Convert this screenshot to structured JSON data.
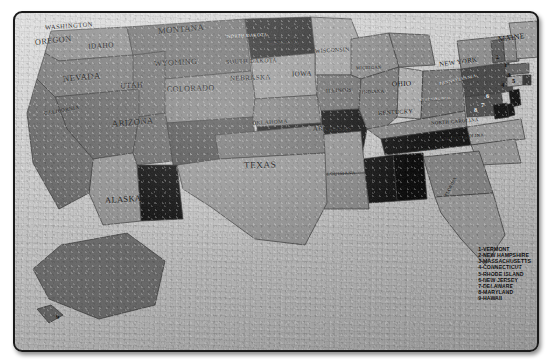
{
  "map": {
    "title": "United States of America",
    "type": "political-state-map",
    "style": "grayscale textured paper",
    "frame": {
      "border_color": "#1a1a1a",
      "background_color": "#cfcfcf"
    },
    "states": [
      {
        "name": "WASHINGTON",
        "x": 30,
        "y": 9,
        "size": 6.6,
        "rot": -4,
        "light": false,
        "fill": "#8d8d8d"
      },
      {
        "name": "OREGON",
        "x": 20,
        "y": 23,
        "size": 8.2,
        "rot": -6,
        "light": false,
        "fill": "#7a7a7a"
      },
      {
        "name": "IDAHO",
        "x": 73,
        "y": 28,
        "size": 7.4,
        "rot": -3,
        "light": false,
        "fill": "#6f6f6f"
      },
      {
        "name": "MONTANA",
        "x": 143,
        "y": 11,
        "size": 8.6,
        "rot": -5,
        "light": false,
        "fill": "#707070"
      },
      {
        "name": "NORTH DAKOTA",
        "x": 212,
        "y": 20,
        "size": 4.6,
        "rot": -3,
        "light": true,
        "fill": "#2b2b2b"
      },
      {
        "name": "MINNESOTA",
        "x": 253,
        "y": 26,
        "size": 4.8,
        "rot": -2,
        "light": false,
        "fill": "#a6a6a6"
      },
      {
        "name": "WISCONSIN",
        "x": 300,
        "y": 34,
        "size": 5.6,
        "rot": -3,
        "light": false,
        "fill": "#8f8f8f"
      },
      {
        "name": "SOUTH DAKOTA",
        "x": 211,
        "y": 45,
        "size": 6.0,
        "rot": -2,
        "light": false,
        "fill": "#9c9c9c"
      },
      {
        "name": "WYOMING",
        "x": 139,
        "y": 45,
        "size": 8.0,
        "rot": -3,
        "light": false,
        "fill": "#858585"
      },
      {
        "name": "NEVADA",
        "x": 48,
        "y": 59,
        "size": 8.6,
        "rot": -5,
        "light": false,
        "fill": "#6a6a6a"
      },
      {
        "name": "UTAH",
        "x": 105,
        "y": 68,
        "size": 8.0,
        "rot": -3,
        "light": false,
        "fill": "#6b6b6b"
      },
      {
        "name": "COLORADO",
        "x": 152,
        "y": 71,
        "size": 8.0,
        "rot": -2,
        "light": false,
        "fill": "#545454"
      },
      {
        "name": "NEBRASKA",
        "x": 215,
        "y": 61,
        "size": 7.0,
        "rot": -2,
        "light": false,
        "fill": "#848484"
      },
      {
        "name": "IOWA",
        "x": 277,
        "y": 57,
        "size": 7.0,
        "rot": -2,
        "light": false,
        "fill": "#777777"
      },
      {
        "name": "ILLINOIS",
        "x": 311,
        "y": 74,
        "size": 5.4,
        "rot": -2,
        "light": false,
        "fill": "#7f7f7f"
      },
      {
        "name": "INDIANA",
        "x": 347,
        "y": 76,
        "size": 4.6,
        "rot": -2,
        "light": false,
        "fill": "#b0b0b0"
      },
      {
        "name": "MICHIGAN",
        "x": 341,
        "y": 52,
        "size": 4.4,
        "rot": -2,
        "light": false,
        "fill": "#8a8a8a"
      },
      {
        "name": "OHIO",
        "x": 377,
        "y": 67,
        "size": 7.2,
        "rot": -2,
        "light": false,
        "fill": "#7d7d7d"
      },
      {
        "name": "PENNSYLVANIA",
        "x": 424,
        "y": 64,
        "size": 4.4,
        "rot": -12,
        "light": true,
        "fill": "#4b4b4b"
      },
      {
        "name": "NEW YORK",
        "x": 424,
        "y": 45,
        "size": 6.6,
        "rot": -7,
        "light": false,
        "fill": "#909090"
      },
      {
        "name": "MAINE",
        "x": 483,
        "y": 20,
        "size": 7.6,
        "rot": -8,
        "light": false,
        "fill": "#9e9e9e"
      },
      {
        "name": "WEST VIRGINIA",
        "x": 404,
        "y": 84,
        "size": 3.4,
        "rot": -4,
        "light": true,
        "fill": "#555555"
      },
      {
        "name": "KENTUCKY",
        "x": 363,
        "y": 96,
        "size": 5.8,
        "rot": -3,
        "light": false,
        "fill": "#8f8f8f"
      },
      {
        "name": "NORTH CAROLINA",
        "x": 416,
        "y": 106,
        "size": 4.8,
        "rot": -4,
        "light": false,
        "fill": "#a3a3a3"
      },
      {
        "name": "SOUTH CAROLINA",
        "x": 425,
        "y": 121,
        "size": 4.4,
        "rot": -4,
        "light": false,
        "fill": "#a0a0a0"
      },
      {
        "name": "GEORGIA",
        "x": 397,
        "y": 134,
        "size": 4.8,
        "rot": -6,
        "light": false,
        "fill": "#8c8c8c"
      },
      {
        "name": "FLORIDA",
        "x": 425,
        "y": 171,
        "size": 4.2,
        "rot": -62,
        "light": false,
        "fill": "#a5a5a5"
      },
      {
        "name": "ARKANSAS",
        "x": 298,
        "y": 111,
        "size": 6.6,
        "rot": -2,
        "light": false,
        "fill": "#9a9a9a"
      },
      {
        "name": "LOUISIANA",
        "x": 312,
        "y": 158,
        "size": 4.6,
        "rot": -3,
        "light": false,
        "fill": "#909090"
      },
      {
        "name": "OKLAHOMA",
        "x": 237,
        "y": 106,
        "size": 5.6,
        "rot": -3,
        "light": false,
        "fill": "#7b7b7b"
      },
      {
        "name": "TEXAS",
        "x": 229,
        "y": 147,
        "size": 9.4,
        "rot": -2,
        "light": false,
        "fill": "#9e9e9e"
      },
      {
        "name": "ARIZONA",
        "x": 97,
        "y": 104,
        "size": 8.6,
        "rot": -5,
        "light": false,
        "fill": "#9a9a9a"
      },
      {
        "name": "ALASKA",
        "x": 90,
        "y": 182,
        "size": 8.4,
        "rot": -4,
        "light": false,
        "fill": "#737373"
      },
      {
        "name": "CALIFORNIA",
        "x": 29,
        "y": 94,
        "size": 5.2,
        "rot": -10,
        "light": false,
        "fill": "#707070"
      }
    ],
    "markers": [
      {
        "label": "1",
        "x": 489,
        "y": 48,
        "light": false
      },
      {
        "label": "2",
        "x": 481,
        "y": 40,
        "light": false
      },
      {
        "label": "3",
        "x": 492,
        "y": 58,
        "light": false
      },
      {
        "label": "4",
        "x": 486,
        "y": 68,
        "light": false
      },
      {
        "label": "5",
        "x": 497,
        "y": 64,
        "light": false
      },
      {
        "label": "6",
        "x": 471,
        "y": 79,
        "light": true
      },
      {
        "label": "7",
        "x": 466,
        "y": 88,
        "light": true
      },
      {
        "label": "8",
        "x": 459,
        "y": 93,
        "light": true
      },
      {
        "label": "9",
        "x": 41,
        "y": 300,
        "light": false
      }
    ],
    "legend": {
      "entries": [
        "1-VERMONT",
        "2-NEW HAMPSHIRE",
        "3-MASSACHUSETTS",
        "4-CONNECTICUT",
        "5-RHODE ISLAND",
        "6-NEW JERSEY",
        "7-DELAWARE",
        "8-MARYLAND",
        "9-HAWAII"
      ]
    }
  }
}
